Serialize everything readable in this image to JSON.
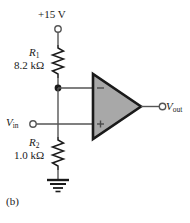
{
  "figure": {
    "caption": "(b)",
    "type": "op-amp non-inverting bias circuit schematic"
  },
  "labels": {
    "supply": "+15 V",
    "vin": "V",
    "vin_sub": "in",
    "vout": "V",
    "vout_sub": "out"
  },
  "components": {
    "r1": {
      "name": "R",
      "subscript": "1",
      "value": "8.2 kΩ"
    },
    "r2": {
      "name": "R",
      "subscript": "2",
      "value": "1.0 kΩ"
    },
    "opamp": {
      "inverting_symbol": "−",
      "noninverting_symbol": "+"
    }
  },
  "colors": {
    "wire": "#555555",
    "ink": "#1a1a1a",
    "opamp_fill": "#a8a8a8",
    "opamp_stroke": "#1a1a1a",
    "background": "#ffffff"
  }
}
